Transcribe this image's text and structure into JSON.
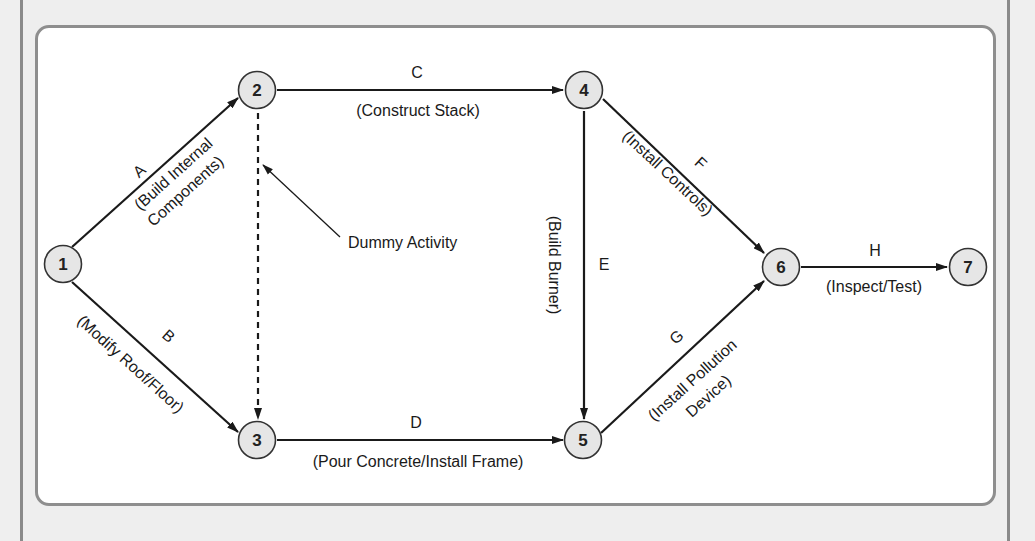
{
  "diagram": {
    "type": "activity-on-arrow network",
    "colors": {
      "background": "#efefef",
      "panel": "#ffffff",
      "panel_border": "#8e8e8e",
      "node_fill": "#e6e6e6",
      "line": "#1a1a1a"
    },
    "nodes": [
      {
        "id": "1",
        "label": "1"
      },
      {
        "id": "2",
        "label": "2"
      },
      {
        "id": "3",
        "label": "3"
      },
      {
        "id": "4",
        "label": "4"
      },
      {
        "id": "5",
        "label": "5"
      },
      {
        "id": "6",
        "label": "6"
      },
      {
        "id": "7",
        "label": "7"
      }
    ],
    "activities": [
      {
        "letter": "A",
        "from": "1",
        "to": "2",
        "desc_line1": "(Build Internal",
        "desc_line2": "Components)"
      },
      {
        "letter": "B",
        "from": "1",
        "to": "3",
        "desc_line1": "(Modify Roof/Floor)"
      },
      {
        "letter": "C",
        "from": "2",
        "to": "4",
        "desc_line1": "(Construct Stack)"
      },
      {
        "letter": "D",
        "from": "3",
        "to": "5",
        "desc_line1": "(Pour Concrete/Install Frame)"
      },
      {
        "letter": "E",
        "from": "4",
        "to": "5",
        "desc_line1": "(Build Burner)"
      },
      {
        "letter": "F",
        "from": "4",
        "to": "6",
        "desc_line1": "(Install Controls)"
      },
      {
        "letter": "G",
        "from": "5",
        "to": "6",
        "desc_line1": "(Install Pollution",
        "desc_line2": "Device)"
      },
      {
        "letter": "H",
        "from": "6",
        "to": "7",
        "desc_line1": "(Inspect/Test)"
      }
    ],
    "dummy": {
      "from": "2",
      "to": "3",
      "label": "Dummy Activity"
    }
  }
}
